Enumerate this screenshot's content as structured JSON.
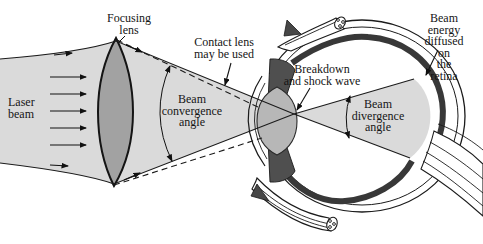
{
  "figure": {
    "labels": {
      "focusing_lens": "Focusing\nlens",
      "laser_beam": "Laser\nbeam",
      "contact_lens": "Contact lens\nmay be used",
      "beam_convergence": "Beam\nconvergence\nangle",
      "breakdown": "Breakdown\nand shock wave",
      "beam_divergence": "Beam\ndivergence\nangle",
      "beam_energy": "Beam energy\ndiffused on\nthe retina"
    },
    "colors": {
      "background": "#ffffff",
      "beam_fill": "#dadada",
      "lens_fill": "#a2a2a2",
      "eye_lens_fill": "#b7b7b7",
      "iris_fill": "#4f4f4f",
      "retina_band": "#383838",
      "outline": "#1b1b1b"
    }
  }
}
